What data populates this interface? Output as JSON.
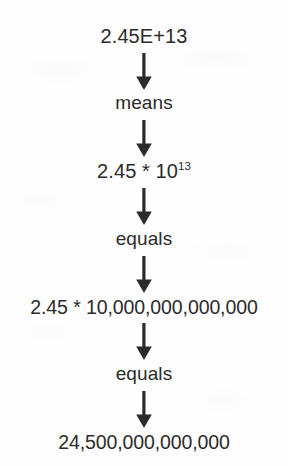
{
  "diagram": {
    "text_color": "#2b2b2b",
    "background_color": "#fefefe",
    "arrow_color": "#2b2b2b",
    "steps": [
      {
        "kind": "value",
        "text": "2.45E+13"
      },
      {
        "kind": "word",
        "text": "means"
      },
      {
        "kind": "value",
        "base": "2.45 * 10",
        "exponent": "13"
      },
      {
        "kind": "word",
        "text": "equals"
      },
      {
        "kind": "wide",
        "text": "2.45 * 10,000,000,000,000"
      },
      {
        "kind": "word",
        "text": "equals"
      },
      {
        "kind": "wide",
        "text": "24,500,000,000,000"
      }
    ],
    "arrows": [
      {
        "label": "arrow-1",
        "direction": "down"
      },
      {
        "label": "arrow-2",
        "direction": "down"
      },
      {
        "label": "arrow-3",
        "direction": "down"
      },
      {
        "label": "arrow-4",
        "direction": "down"
      },
      {
        "label": "arrow-5",
        "direction": "down"
      },
      {
        "label": "arrow-6",
        "direction": "down"
      }
    ]
  }
}
